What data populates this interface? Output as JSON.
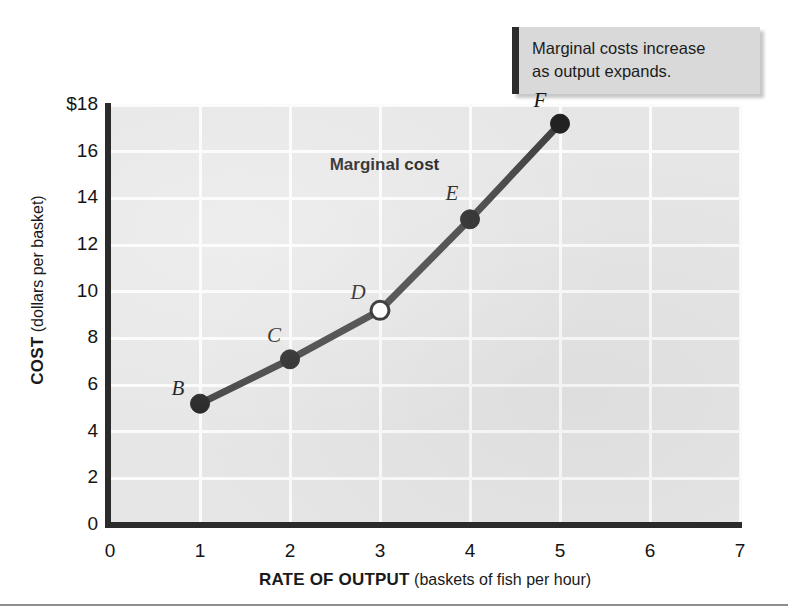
{
  "callout": {
    "lines": [
      "Marginal costs increase",
      "as output expands."
    ]
  },
  "chart_data": {
    "type": "line",
    "title": "",
    "series_label": "Marginal cost",
    "xlabel_bold": "RATE OF OUTPUT",
    "xlabel_rest": " (baskets of fish per hour)",
    "ylabel_bold": "COST",
    "ylabel_rest": " (dollars per basket)",
    "xlim": [
      0,
      7
    ],
    "ylim": [
      0,
      18
    ],
    "grid": true,
    "legend": "none",
    "xticks": [
      "0",
      "1",
      "2",
      "3",
      "4",
      "5",
      "6",
      "7"
    ],
    "yticks": [
      "0",
      "2",
      "4",
      "6",
      "8",
      "10",
      "12",
      "14",
      "16",
      "$18"
    ],
    "x": [
      1,
      2,
      3,
      4,
      5
    ],
    "values": [
      5.2,
      7.1,
      9.2,
      13.1,
      17.2
    ],
    "point_labels": [
      "B",
      "C",
      "D",
      "E",
      "F"
    ],
    "point_styles": [
      "filled",
      "filled",
      "open",
      "filled",
      "filled"
    ],
    "line_color": "#3c3c3c",
    "marker_color": "#1e1e1e",
    "open_marker_fill": "#ffffff",
    "plot_background": "#e6e6e6",
    "gridline_color": "#fbfbfb"
  }
}
